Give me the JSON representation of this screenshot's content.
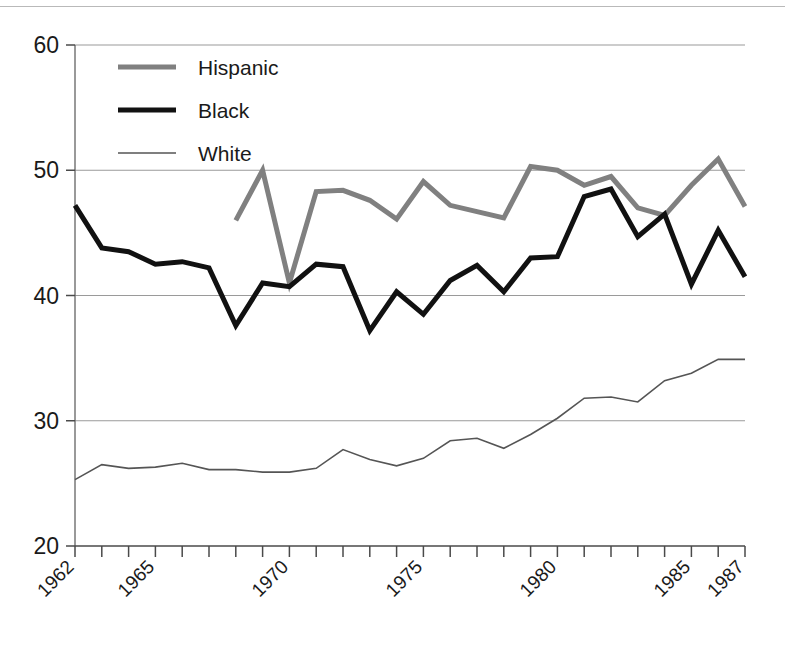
{
  "chart_data": {
    "type": "line",
    "title": "",
    "subtitle": "",
    "xlabel": "",
    "ylabel": "",
    "xlim": [
      1962,
      1987
    ],
    "ylim": [
      20,
      60
    ],
    "y_ticks": [
      20,
      30,
      40,
      50,
      60
    ],
    "x_ticks": [
      1962,
      1963,
      1964,
      1965,
      1966,
      1967,
      1968,
      1969,
      1970,
      1971,
      1972,
      1973,
      1974,
      1975,
      1976,
      1977,
      1978,
      1979,
      1980,
      1981,
      1982,
      1983,
      1984,
      1985,
      1986,
      1987
    ],
    "x_tick_labels": [
      "1962",
      "1965",
      "1970",
      "1975",
      "1980",
      "1985",
      "1987"
    ],
    "x_tick_label_years": [
      1962,
      1965,
      1970,
      1975,
      1980,
      1985,
      1987
    ],
    "grid": "horizontal",
    "legend_position": "top-left-inside",
    "series": [
      {
        "name": "Hispanic",
        "color": "#808080",
        "width": 5,
        "x": [
          1968,
          1969,
          1970,
          1971,
          1972,
          1973,
          1974,
          1975,
          1976,
          1977,
          1978,
          1979,
          1980,
          1981,
          1982,
          1983,
          1984,
          1985,
          1986,
          1987
        ],
        "values": [
          46.0,
          50.0,
          41.0,
          48.3,
          48.4,
          47.6,
          46.1,
          49.1,
          47.2,
          46.7,
          46.2,
          50.3,
          50.0,
          48.8,
          49.5,
          47.0,
          46.4,
          48.8,
          50.9,
          47.1
        ]
      },
      {
        "name": "Black",
        "color": "#111111",
        "width": 5,
        "x": [
          1962,
          1963,
          1964,
          1965,
          1966,
          1967,
          1968,
          1969,
          1970,
          1971,
          1972,
          1973,
          1974,
          1975,
          1976,
          1977,
          1978,
          1979,
          1980,
          1981,
          1982,
          1983,
          1984,
          1985,
          1986,
          1987
        ],
        "values": [
          47.2,
          43.8,
          43.5,
          42.5,
          42.7,
          42.2,
          37.6,
          41.0,
          40.7,
          42.5,
          42.3,
          37.2,
          40.3,
          38.5,
          41.2,
          42.4,
          40.3,
          43.0,
          43.1,
          47.9,
          48.5,
          44.7,
          46.5,
          40.9,
          45.2,
          41.5
        ]
      },
      {
        "name": "White",
        "color": "#555555",
        "width": 1.6,
        "x": [
          1962,
          1963,
          1964,
          1965,
          1966,
          1967,
          1968,
          1969,
          1970,
          1971,
          1972,
          1973,
          1974,
          1975,
          1976,
          1977,
          1978,
          1979,
          1980,
          1981,
          1982,
          1983,
          1984,
          1985,
          1986,
          1987
        ],
        "values": [
          25.3,
          26.5,
          26.2,
          26.3,
          26.6,
          26.1,
          26.1,
          25.9,
          25.9,
          26.2,
          27.7,
          26.9,
          26.4,
          27.0,
          28.4,
          28.6,
          27.8,
          28.9,
          30.2,
          31.8,
          31.9,
          31.5,
          33.2,
          33.8,
          34.9,
          34.9
        ]
      }
    ]
  },
  "legend": {
    "items": [
      {
        "label": "Hispanic"
      },
      {
        "label": "Black"
      },
      {
        "label": "White"
      }
    ]
  },
  "axes": {
    "y_labels": [
      "60",
      "50",
      "40",
      "30",
      "20"
    ],
    "x_labels": [
      "1962",
      "1965",
      "1970",
      "1975",
      "1980",
      "1985",
      "1987"
    ]
  }
}
